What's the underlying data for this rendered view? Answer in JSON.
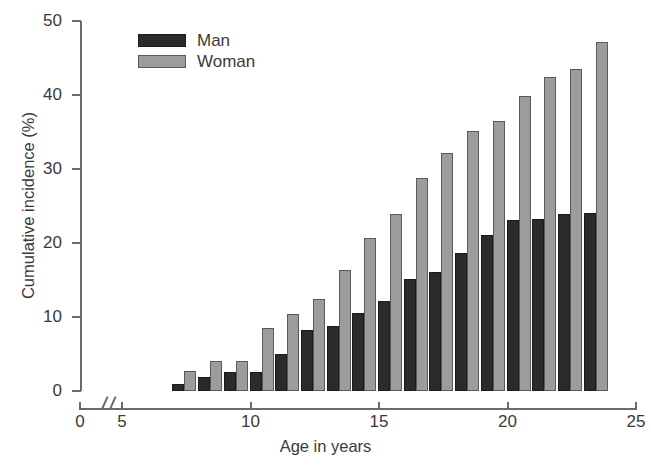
{
  "chart_data": {
    "type": "bar",
    "title": "",
    "xlabel": "Age in years",
    "ylabel": "Cumulative incidence (%)",
    "xlim": [
      0,
      25
    ],
    "ylim": [
      0,
      50
    ],
    "x_axis_break": {
      "from": 0.6,
      "to": 4.4,
      "note": "broken axis between 0 and 5"
    },
    "xticks": [
      0,
      5,
      10,
      15,
      20,
      25
    ],
    "xtick_labels": [
      "0",
      "5",
      "10",
      "15",
      "20",
      "25"
    ],
    "yticks": [
      0,
      10,
      20,
      30,
      40,
      50
    ],
    "ytick_labels": [
      "0",
      "10",
      "20",
      "30",
      "40",
      "50"
    ],
    "grid": false,
    "legend_position": "top-center-left",
    "categories": [
      7,
      8,
      9,
      10,
      11,
      12,
      13,
      14,
      15,
      16,
      17,
      18,
      19,
      20,
      21,
      22,
      23
    ],
    "series": [
      {
        "name": "Man",
        "color": "#2b2b2b",
        "values": [
          1.0,
          1.9,
          2.6,
          2.6,
          5.0,
          8.2,
          8.8,
          10.6,
          12.1,
          15.2,
          16.1,
          18.6,
          21.1,
          23.1,
          23.3,
          23.9,
          24.1
        ]
      },
      {
        "name": "Woman",
        "color": "#9c9c9c",
        "values": [
          2.7,
          4.0,
          4.0,
          8.5,
          10.4,
          12.5,
          16.4,
          20.7,
          23.9,
          28.8,
          32.1,
          35.2,
          36.5,
          39.9,
          42.4,
          43.5,
          47.1
        ]
      }
    ]
  },
  "legend": {
    "items": [
      {
        "label": "Man",
        "color": "#2b2b2b"
      },
      {
        "label": "Woman",
        "color": "#9c9c9c"
      }
    ]
  },
  "axis": {
    "y_title": "Cumulative incidence (%)",
    "x_title": "Age in years"
  }
}
